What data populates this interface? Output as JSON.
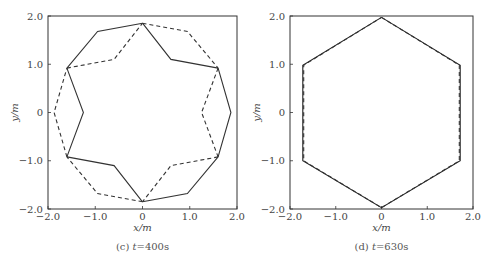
{
  "chart_data": [
    {
      "type": "line",
      "panel": "c",
      "caption": "(c) t=400s",
      "caption_prefix": "(c) ",
      "caption_var": "t",
      "caption_value": "=400s",
      "xlabel": "x/m",
      "ylabel": "y/m",
      "xlim": [
        -2.0,
        2.0
      ],
      "ylim": [
        -2.0,
        2.0
      ],
      "xticks": [
        "-2.0",
        "-1.0",
        "0",
        "1.0",
        "2.0"
      ],
      "yticks": [
        "-2.0",
        "-1.0",
        "0",
        "1.0",
        "2.0"
      ],
      "grid": false,
      "series": [
        {
          "name": "solid",
          "style": "solid",
          "points": [
            [
              0.0,
              1.85
            ],
            [
              0.95,
              1.68
            ],
            [
              1.6,
              0.92
            ],
            [
              1.87,
              0.0
            ],
            [
              1.6,
              -0.92
            ],
            [
              0.95,
              -1.68
            ],
            [
              0.0,
              -1.85
            ],
            [
              -0.95,
              -1.68
            ],
            [
              -1.6,
              -0.92
            ],
            [
              -1.87,
              0.0
            ],
            [
              -1.6,
              0.92
            ],
            [
              -0.95,
              1.68
            ],
            [
              0.0,
              1.85
            ]
          ],
          "inner_points": [
            [
              0.0,
              1.85
            ],
            [
              -0.6,
              1.1
            ],
            [
              -1.6,
              0.92
            ],
            [
              -1.25,
              0.0
            ],
            [
              -1.6,
              -0.92
            ],
            [
              -0.6,
              -1.1
            ],
            [
              0.0,
              -1.85
            ],
            [
              0.6,
              -1.1
            ],
            [
              1.6,
              -0.92
            ],
            [
              1.25,
              0.0
            ],
            [
              1.6,
              0.92
            ],
            [
              0.6,
              1.1
            ],
            [
              0.0,
              1.85
            ]
          ]
        },
        {
          "name": "dashed",
          "style": "dashed"
        }
      ]
    },
    {
      "type": "line",
      "panel": "d",
      "caption": "(d) t=630s",
      "caption_prefix": "(d) ",
      "caption_var": "t",
      "caption_value": "=630s",
      "xlabel": "x/m",
      "ylabel": "y/m",
      "xlim": [
        -2.0,
        2.0
      ],
      "ylim": [
        -2.0,
        2.0
      ],
      "xticks": [
        "-2.0",
        "-1.0",
        "0",
        "1.0",
        "2.0"
      ],
      "yticks": [
        "-2.0",
        "-1.0",
        "0",
        "1.0",
        "2.0"
      ],
      "grid": false,
      "series": [
        {
          "name": "solid",
          "style": "solid",
          "points": [
            [
              0.0,
              1.97
            ],
            [
              1.72,
              0.98
            ],
            [
              1.72,
              -1.0
            ],
            [
              0.0,
              -1.97
            ],
            [
              -1.72,
              -1.0
            ],
            [
              -1.72,
              0.98
            ],
            [
              0.0,
              1.97
            ]
          ]
        },
        {
          "name": "dashed",
          "style": "dashed",
          "points": [
            [
              0.0,
              1.97
            ],
            [
              1.7,
              0.98
            ],
            [
              1.7,
              -1.0
            ],
            [
              0.0,
              -1.97
            ],
            [
              -1.7,
              -1.0
            ],
            [
              -1.7,
              0.98
            ],
            [
              0.0,
              1.97
            ]
          ]
        }
      ]
    }
  ]
}
